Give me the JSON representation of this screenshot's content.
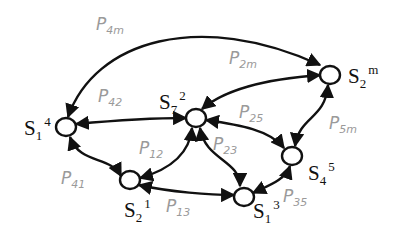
{
  "nodes": [
    {
      "id": "n14",
      "base": "S",
      "sub": "1",
      "sup": "4"
    },
    {
      "id": "n72",
      "base": "S",
      "sub": "7",
      "sup": "2"
    },
    {
      "id": "n2m",
      "base": "S",
      "sub": "2",
      "sup": "m"
    },
    {
      "id": "n45",
      "base": "S",
      "sub": "4",
      "sup": "5"
    },
    {
      "id": "n21",
      "base": "S",
      "sub": "2",
      "sup": "1"
    },
    {
      "id": "n13",
      "base": "S",
      "sub": "1",
      "sup": "3"
    }
  ],
  "edges": [
    {
      "base": "P",
      "sub": "4m"
    },
    {
      "base": "P",
      "sub": "2m"
    },
    {
      "base": "P",
      "sub": "42"
    },
    {
      "base": "P",
      "sub": "25"
    },
    {
      "base": "P",
      "sub": "5m"
    },
    {
      "base": "P",
      "sub": "12"
    },
    {
      "base": "P",
      "sub": "23"
    },
    {
      "base": "P",
      "sub": "41"
    },
    {
      "base": "P",
      "sub": "13"
    },
    {
      "base": "P",
      "sub": "35"
    }
  ]
}
